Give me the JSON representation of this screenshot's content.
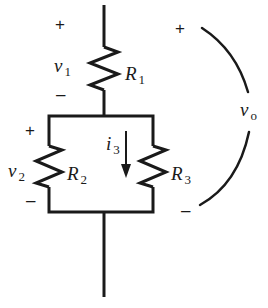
{
  "diagram": {
    "type": "circuit",
    "colors": {
      "stroke": "#1a1a1a",
      "background": "#ffffff"
    },
    "components": {
      "r1": {
        "symbol": "R",
        "sub": "1"
      },
      "r2": {
        "symbol": "R",
        "sub": "2"
      },
      "r3": {
        "symbol": "R",
        "sub": "3"
      }
    },
    "voltages": {
      "v1": {
        "symbol": "v",
        "sub": "1",
        "plus": "+",
        "minus": "–"
      },
      "v2": {
        "symbol": "v",
        "sub": "2",
        "plus": "+",
        "minus": "–"
      },
      "v0": {
        "symbol": "v",
        "sub": "o",
        "plus": "+",
        "minus": "–"
      }
    },
    "currents": {
      "i3": {
        "symbol": "i",
        "sub": "3",
        "direction": "down"
      }
    }
  }
}
